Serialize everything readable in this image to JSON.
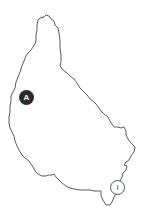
{
  "map": {
    "outline_color": "#5a5a5a",
    "background": "#ffffff",
    "markers": [
      {
        "label": "A",
        "style": "filled",
        "fill": "#2b2b2b",
        "text_color": "#ffffff"
      },
      {
        "label": "I",
        "style": "outlined",
        "fill": "#ffffff",
        "text_color": "#444444"
      }
    ]
  }
}
